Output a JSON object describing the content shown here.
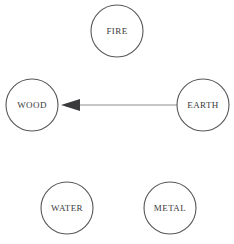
{
  "diagram": {
    "background_color": "#ffffff",
    "width": 234,
    "height": 244,
    "node_style": {
      "radius": 26,
      "fill": "#ffffff",
      "stroke_color": "#575759",
      "stroke_width": 1.1,
      "label_color": "#3a3a3c",
      "label_font_size": 9
    },
    "edge_style": {
      "line_color": "#8e8e92",
      "line_width": 1.1,
      "arrowhead_color": "#3a3a3c",
      "arrowhead_length": 19,
      "arrowhead_halfwidth": 6
    },
    "nodes": [
      {
        "id": "fire",
        "label": "FIRE",
        "cx": 117,
        "cy": 31,
        "r": 26
      },
      {
        "id": "wood",
        "label": "WOOD",
        "cx": 32,
        "cy": 105,
        "r": 26
      },
      {
        "id": "earth",
        "label": "EARTH",
        "cx": 203,
        "cy": 105,
        "r": 26
      },
      {
        "id": "water",
        "label": "WATER",
        "cx": 67,
        "cy": 208,
        "r": 26
      },
      {
        "id": "metal",
        "label": "METAL",
        "cx": 170,
        "cy": 208,
        "r": 26
      }
    ],
    "edges": [
      {
        "id": "earth-to-wood",
        "source": "earth",
        "target": "wood",
        "label": "",
        "directed": true,
        "x1": 177,
        "y1": 105,
        "x2": 61,
        "y2": 105
      }
    ]
  }
}
